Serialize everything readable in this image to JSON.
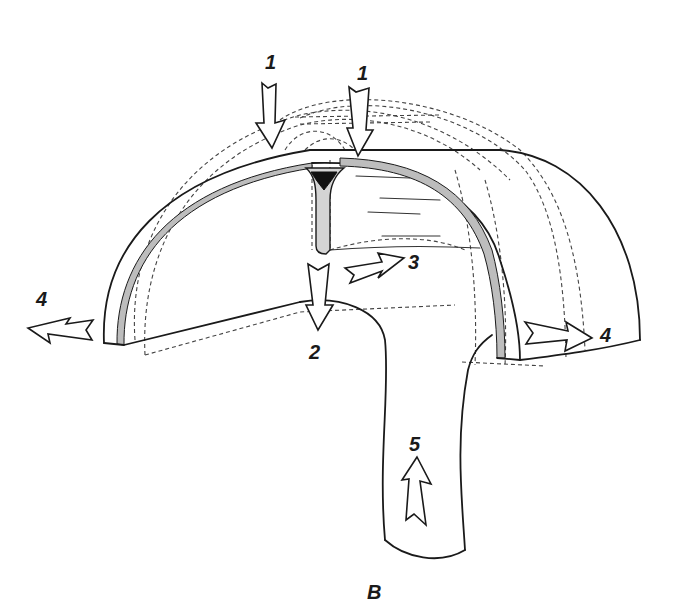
{
  "figure": {
    "labels": [
      {
        "id": "force-1-left",
        "text": "1"
      },
      {
        "id": "force-1-right",
        "text": "1"
      },
      {
        "id": "force-2",
        "text": "2"
      },
      {
        "id": "force-3",
        "text": "3"
      },
      {
        "id": "force-4-left",
        "text": "4"
      },
      {
        "id": "force-4-right",
        "text": "4"
      },
      {
        "id": "force-5",
        "text": "5"
      },
      {
        "id": "part-b",
        "text": "B"
      }
    ],
    "arrows": [
      {
        "label": "1",
        "direction": "down",
        "position": "top-left flange"
      },
      {
        "label": "1",
        "direction": "down",
        "position": "top-right flange"
      },
      {
        "label": "2",
        "direction": "down",
        "position": "web base"
      },
      {
        "label": "3",
        "direction": "right-up",
        "position": "web side"
      },
      {
        "label": "4",
        "direction": "left",
        "position": "left end"
      },
      {
        "label": "4",
        "direction": "right",
        "position": "right end"
      },
      {
        "label": "5",
        "direction": "up",
        "position": "leg B"
      }
    ],
    "colors": {
      "line": "#1a1a1a",
      "web_fill": "#d4d4d4",
      "weld_fill": "#111111",
      "background": "#ffffff"
    }
  }
}
